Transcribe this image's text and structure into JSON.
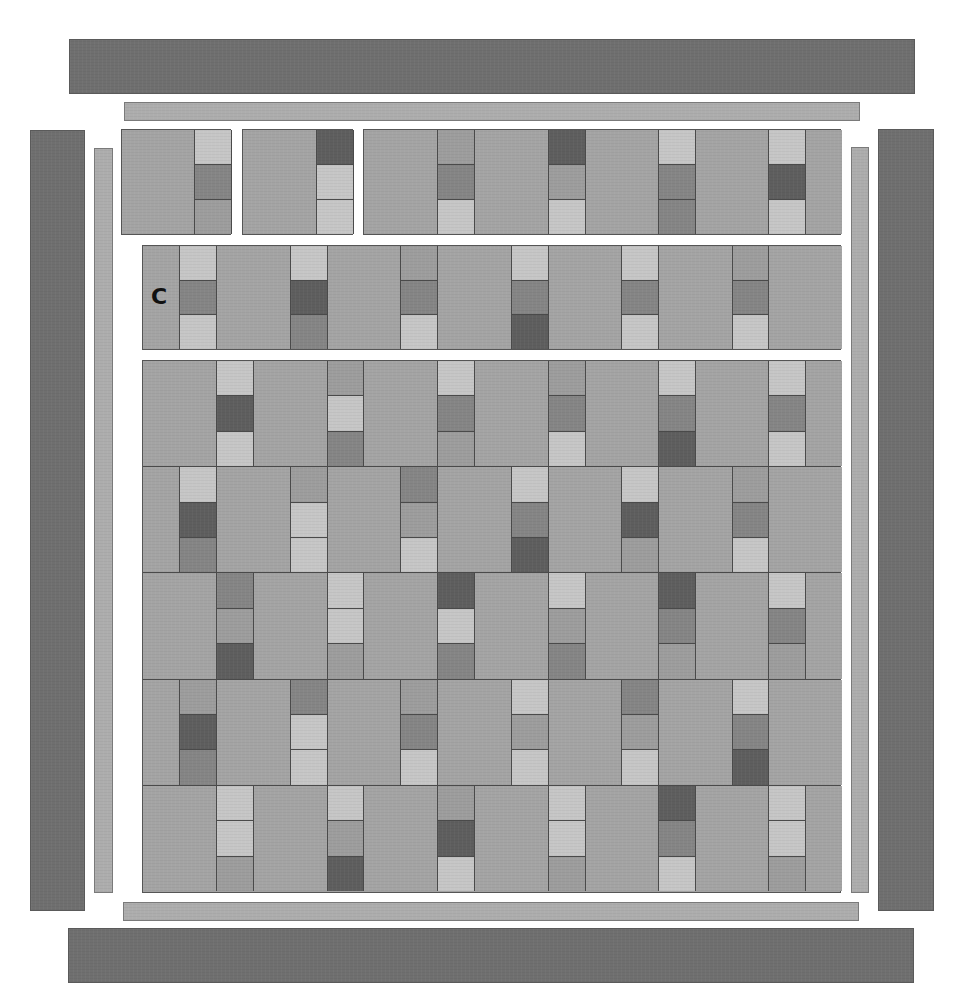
{
  "diagram": {
    "type": "quilt-layout",
    "palette": {
      "L": "#c6c6c6",
      "M": "#9d9d9d",
      "K": "#858585",
      "D": "#5e5e5e",
      "background_square": "#a4a4a4",
      "outer_border": "#6f6f6f",
      "inner_border": "#adadad"
    },
    "labels": {
      "row1_label": "C",
      "row2_label": "C"
    },
    "borders": {
      "outer": [
        {
          "side": "top",
          "x": 69,
          "y": 39,
          "w": 846,
          "h": 55
        },
        {
          "side": "bottom",
          "x": 68,
          "y": 928,
          "w": 846,
          "h": 55
        },
        {
          "side": "left",
          "x": 30,
          "y": 130,
          "w": 55,
          "h": 781
        },
        {
          "side": "right",
          "x": 878,
          "y": 129,
          "w": 56,
          "h": 782
        }
      ],
      "inner": [
        {
          "side": "top",
          "x": 124,
          "y": 102,
          "w": 736,
          "h": 19
        },
        {
          "side": "bottom",
          "x": 123,
          "y": 902,
          "w": 736,
          "h": 19
        },
        {
          "side": "left",
          "x": 94,
          "y": 148,
          "w": 19,
          "h": 745
        },
        {
          "side": "right",
          "x": 851,
          "y": 147,
          "w": 18,
          "h": 746
        }
      ]
    },
    "top_row_1": {
      "y": 129,
      "h": 106,
      "blocks": [
        {
          "x": 121,
          "w": 110,
          "pieces": [
            {
              "type": "square",
              "w": 73
            },
            {
              "type": "strip",
              "w": 37,
              "cells": [
                "L",
                "K",
                "M"
              ]
            }
          ]
        },
        {
          "x": 242,
          "w": 111,
          "pieces": [
            {
              "type": "square",
              "w": 74
            },
            {
              "type": "strip",
              "w": 37,
              "cells": [
                "D",
                "L",
                "L"
              ]
            }
          ]
        },
        {
          "x": 363,
          "w": 478,
          "label_piece": 12,
          "pieces": [
            {
              "type": "square",
              "w": 74
            },
            {
              "type": "strip",
              "w": 37,
              "cells": [
                "M",
                "K",
                "L"
              ]
            },
            {
              "type": "square",
              "w": 74
            },
            {
              "type": "strip",
              "w": 37,
              "cells": [
                "D",
                "M",
                "L"
              ]
            },
            {
              "type": "square",
              "w": 73
            },
            {
              "type": "strip",
              "w": 37,
              "cells": [
                "L",
                "K",
                "K"
              ]
            },
            {
              "type": "square",
              "w": 73
            },
            {
              "type": "strip",
              "w": 37,
              "cells": [
                "L",
                "D",
                "L"
              ]
            },
            {
              "type": "square",
              "w": 36
            }
          ]
        }
      ]
    },
    "top_row_2": {
      "x": 142,
      "y": 245,
      "w": 699,
      "h": 105,
      "label_piece": 0,
      "pieces": [
        {
          "type": "square",
          "w": 37
        },
        {
          "type": "strip",
          "w": 37,
          "cells": [
            "L",
            "K",
            "L"
          ]
        },
        {
          "type": "square",
          "w": 74
        },
        {
          "type": "strip",
          "w": 37,
          "cells": [
            "L",
            "D",
            "K"
          ]
        },
        {
          "type": "square",
          "w": 73
        },
        {
          "type": "strip",
          "w": 37,
          "cells": [
            "M",
            "K",
            "L"
          ]
        },
        {
          "type": "square",
          "w": 74
        },
        {
          "type": "strip",
          "w": 37,
          "cells": [
            "L",
            "K",
            "D"
          ]
        },
        {
          "type": "square",
          "w": 73
        },
        {
          "type": "strip",
          "w": 37,
          "cells": [
            "L",
            "K",
            "L"
          ]
        },
        {
          "type": "square",
          "w": 74
        },
        {
          "type": "strip",
          "w": 36,
          "cells": [
            "M",
            "K",
            "L"
          ]
        },
        {
          "type": "square",
          "w": 73
        }
      ]
    },
    "main_grid": {
      "x": 142,
      "y": 360,
      "w": 699,
      "h": 533,
      "rows": [
        {
          "pieces": [
            {
              "type": "square",
              "w": 74
            },
            {
              "type": "strip",
              "w": 37,
              "cells": [
                "L",
                "D",
                "L"
              ]
            },
            {
              "type": "square",
              "w": 74
            },
            {
              "type": "strip",
              "w": 36,
              "cells": [
                "M",
                "L",
                "K"
              ]
            },
            {
              "type": "square",
              "w": 74
            },
            {
              "type": "strip",
              "w": 37,
              "cells": [
                "L",
                "K",
                "M"
              ]
            },
            {
              "type": "square",
              "w": 74
            },
            {
              "type": "strip",
              "w": 37,
              "cells": [
                "M",
                "K",
                "L"
              ]
            },
            {
              "type": "square",
              "w": 73
            },
            {
              "type": "strip",
              "w": 37,
              "cells": [
                "L",
                "K",
                "D"
              ]
            },
            {
              "type": "square",
              "w": 73
            },
            {
              "type": "strip",
              "w": 37,
              "cells": [
                "L",
                "K",
                "L"
              ]
            },
            {
              "type": "square",
              "w": 36
            }
          ]
        },
        {
          "pieces": [
            {
              "type": "square",
              "w": 37
            },
            {
              "type": "strip",
              "w": 37,
              "cells": [
                "L",
                "D",
                "K"
              ]
            },
            {
              "type": "square",
              "w": 74
            },
            {
              "type": "strip",
              "w": 37,
              "cells": [
                "M",
                "L",
                "L"
              ]
            },
            {
              "type": "square",
              "w": 73
            },
            {
              "type": "strip",
              "w": 37,
              "cells": [
                "K",
                "M",
                "L"
              ]
            },
            {
              "type": "square",
              "w": 74
            },
            {
              "type": "strip",
              "w": 37,
              "cells": [
                "L",
                "K",
                "D"
              ]
            },
            {
              "type": "square",
              "w": 73
            },
            {
              "type": "strip",
              "w": 37,
              "cells": [
                "L",
                "D",
                "M"
              ]
            },
            {
              "type": "square",
              "w": 74
            },
            {
              "type": "strip",
              "w": 36,
              "cells": [
                "M",
                "K",
                "L"
              ]
            },
            {
              "type": "square",
              "w": 73
            }
          ]
        },
        {
          "pieces": [
            {
              "type": "square",
              "w": 74
            },
            {
              "type": "strip",
              "w": 37,
              "cells": [
                "K",
                "M",
                "D"
              ]
            },
            {
              "type": "square",
              "w": 74
            },
            {
              "type": "strip",
              "w": 36,
              "cells": [
                "L",
                "L",
                "M"
              ]
            },
            {
              "type": "square",
              "w": 74
            },
            {
              "type": "strip",
              "w": 37,
              "cells": [
                "D",
                "L",
                "K"
              ]
            },
            {
              "type": "square",
              "w": 74
            },
            {
              "type": "strip",
              "w": 37,
              "cells": [
                "L",
                "M",
                "K"
              ]
            },
            {
              "type": "square",
              "w": 73
            },
            {
              "type": "strip",
              "w": 37,
              "cells": [
                "D",
                "K",
                "M"
              ]
            },
            {
              "type": "square",
              "w": 73
            },
            {
              "type": "strip",
              "w": 37,
              "cells": [
                "L",
                "K",
                "M"
              ]
            },
            {
              "type": "square",
              "w": 36
            }
          ]
        },
        {
          "pieces": [
            {
              "type": "square",
              "w": 37
            },
            {
              "type": "strip",
              "w": 37,
              "cells": [
                "M",
                "D",
                "K"
              ]
            },
            {
              "type": "square",
              "w": 74
            },
            {
              "type": "strip",
              "w": 37,
              "cells": [
                "K",
                "L",
                "L"
              ]
            },
            {
              "type": "square",
              "w": 73
            },
            {
              "type": "strip",
              "w": 37,
              "cells": [
                "M",
                "K",
                "L"
              ]
            },
            {
              "type": "square",
              "w": 74
            },
            {
              "type": "strip",
              "w": 37,
              "cells": [
                "L",
                "M",
                "L"
              ]
            },
            {
              "type": "square",
              "w": 73
            },
            {
              "type": "strip",
              "w": 37,
              "cells": [
                "K",
                "M",
                "L"
              ]
            },
            {
              "type": "square",
              "w": 74
            },
            {
              "type": "strip",
              "w": 36,
              "cells": [
                "L",
                "K",
                "D"
              ]
            },
            {
              "type": "square",
              "w": 73
            }
          ]
        },
        {
          "pieces": [
            {
              "type": "square",
              "w": 74
            },
            {
              "type": "strip",
              "w": 37,
              "cells": [
                "L",
                "L",
                "M"
              ]
            },
            {
              "type": "square",
              "w": 74
            },
            {
              "type": "strip",
              "w": 36,
              "cells": [
                "L",
                "M",
                "D"
              ]
            },
            {
              "type": "square",
              "w": 74
            },
            {
              "type": "strip",
              "w": 37,
              "cells": [
                "M",
                "D",
                "L"
              ]
            },
            {
              "type": "square",
              "w": 74
            },
            {
              "type": "strip",
              "w": 37,
              "cells": [
                "L",
                "L",
                "M"
              ]
            },
            {
              "type": "square",
              "w": 73
            },
            {
              "type": "strip",
              "w": 37,
              "cells": [
                "D",
                "K",
                "L"
              ]
            },
            {
              "type": "square",
              "w": 73
            },
            {
              "type": "strip",
              "w": 37,
              "cells": [
                "L",
                "L",
                "M"
              ]
            },
            {
              "type": "square",
              "w": 36
            }
          ]
        }
      ]
    }
  }
}
